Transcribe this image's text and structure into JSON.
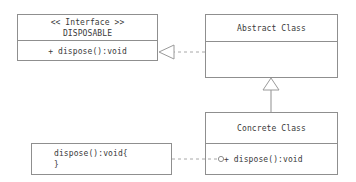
{
  "diagram": {
    "stroke_color": "#8f8f8f",
    "text_color": "#3a3a3a",
    "background_color": "#ffffff"
  },
  "interface_box": {
    "stereotype": "<< Interface >>",
    "name": "DISPOSABLE",
    "operation": "+ dispose():void"
  },
  "abstract_class_box": {
    "name": "Abstract Class",
    "body": ""
  },
  "concrete_class_box": {
    "name": "Concrete Class",
    "operation": "+ dispose():void"
  },
  "note_box": {
    "line1": "dispose():void{",
    "line2": "}"
  },
  "connectors": {
    "realization": "realization-dashed-hollow-triangle",
    "generalization": "generalization-solid-hollow-triangle",
    "socket": "lollipop-socket-circle",
    "note_link": "note-dashed-link"
  }
}
